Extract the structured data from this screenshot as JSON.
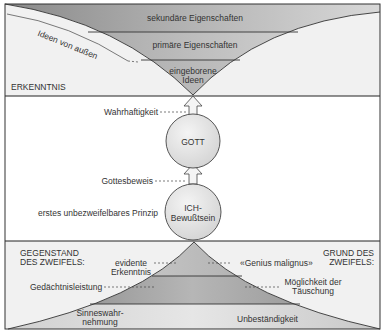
{
  "top_section": {
    "title": "ERKENNTNIS",
    "bands": [
      {
        "label": "sekundäre Eigenschaften"
      },
      {
        "label": "primäre Eigenschaften"
      },
      {
        "label_line1": "eingeborene",
        "label_line2": "Ideen"
      }
    ],
    "curve_label": "Ideen von außen"
  },
  "middle_section": {
    "arrow_top_label": "Wahrhaftigkeit",
    "circle_top": "GOTT",
    "arrow_bottom_label": "Gottesbeweis",
    "circle_bottom_line1": "ICH-",
    "circle_bottom_line2": "Bewußtsein",
    "circle_bottom_note": "erstes unbezweifelbares Prinzip"
  },
  "bottom_section": {
    "left_title_line1": "GEGENSTAND",
    "left_title_line2": "DES ZWEIFELS:",
    "right_title_line1": "GRUND DES",
    "right_title_line2": "ZWEIFELS:",
    "left_labels": [
      {
        "line1": "evidente",
        "line2": "Erkenntnis"
      },
      {
        "line1": "Gedächtnisleistung"
      },
      {
        "line1": "Sinneswahr-",
        "line2": "nehmung"
      }
    ],
    "right_labels": [
      {
        "line1": "«Genius malignus»"
      },
      {
        "line1": "Möglichkeit der",
        "line2": "Täuschung"
      },
      {
        "line1": "Unbeständigkeit"
      }
    ]
  },
  "colors": {
    "frame": "#3a3a3a",
    "background": "#f2f2f2",
    "band_dark": "#8e8e8e",
    "band_light": "#d6d6d6",
    "circle_fill": "#e2e2e2"
  }
}
